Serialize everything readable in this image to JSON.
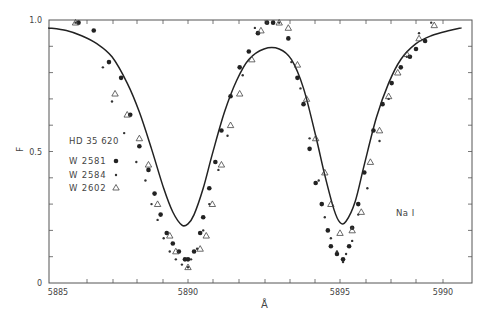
{
  "chart_data": {
    "type": "scatter",
    "title": "",
    "xlabel": "Å",
    "ylabel": "F",
    "xlim": [
      5885.4,
      5899.3
    ],
    "ylim": [
      0,
      1.0
    ],
    "grid": false,
    "x_tick_labels": [
      {
        "label": "5885",
        "px": 58
      },
      {
        "label": "5890",
        "px": 188
      },
      {
        "label": "5895",
        "px": 340
      },
      {
        "label": "5990",
        "px": 443
      }
    ],
    "x_minor_ticks_px": [
      87,
      113,
      137,
      163,
      188,
      213,
      239,
      265,
      290,
      315,
      340,
      366,
      391,
      416,
      443
    ],
    "y_tick_labels": [
      {
        "label": "1.0",
        "value": 1.0
      },
      {
        "label": "0.5",
        "value": 0.5
      },
      {
        "label": "0",
        "value": 0.0
      }
    ],
    "y_minor_ticks": [
      0.1,
      0.2,
      0.3,
      0.4,
      0.5,
      0.6,
      0.7,
      0.8,
      0.9
    ],
    "annotations": [
      {
        "text": "HD 35 620",
        "px": 88,
        "py": 140
      },
      {
        "text": "Na I",
        "px": 402,
        "py": 216
      }
    ],
    "legend": {
      "position": "left-middle",
      "entries": [
        {
          "name": "W 2581",
          "marker": "filled-circle"
        },
        {
          "name": "W 2584",
          "marker": "small-dot"
        },
        {
          "name": "W 2602",
          "marker": "open-triangle"
        }
      ]
    },
    "model_curve": {
      "name": "model profile",
      "x": [
        5885.4,
        5886.0,
        5886.5,
        5887.0,
        5887.5,
        5888.0,
        5888.4,
        5888.8,
        5889.2,
        5889.5,
        5889.8,
        5890.0,
        5890.2,
        5890.5,
        5890.8,
        5891.2,
        5891.6,
        5892.0,
        5892.5,
        5893.0,
        5893.4,
        5893.8,
        5894.2,
        5894.5,
        5894.8,
        5895.0,
        5895.2,
        5895.5,
        5895.8,
        5896.2,
        5896.6,
        5897.0,
        5897.5,
        5898.0,
        5898.6,
        5899.0
      ],
      "y": [
        0.97,
        0.96,
        0.94,
        0.91,
        0.86,
        0.76,
        0.65,
        0.51,
        0.36,
        0.27,
        0.22,
        0.225,
        0.26,
        0.36,
        0.49,
        0.65,
        0.77,
        0.85,
        0.89,
        0.89,
        0.85,
        0.74,
        0.56,
        0.41,
        0.28,
        0.23,
        0.235,
        0.31,
        0.45,
        0.63,
        0.76,
        0.85,
        0.91,
        0.94,
        0.96,
        0.97
      ]
    },
    "series": [
      {
        "name": "W 2581",
        "marker": "filled-circle",
        "x": [
          5886.4,
          5886.9,
          5887.4,
          5887.8,
          5888.1,
          5888.4,
          5888.7,
          5888.9,
          5889.1,
          5889.3,
          5889.5,
          5889.7,
          5889.9,
          5890.0,
          5890.2,
          5890.4,
          5890.5,
          5890.7,
          5890.9,
          5891.1,
          5891.4,
          5891.7,
          5892.0,
          5892.3,
          5892.6,
          5892.8,
          5893.3,
          5893.6,
          5893.8,
          5894.0,
          5894.2,
          5894.4,
          5894.6,
          5894.7,
          5894.9,
          5895.1,
          5895.3,
          5895.4,
          5895.6,
          5895.8,
          5896.1,
          5896.4,
          5896.7,
          5897.0,
          5897.3,
          5897.5,
          5897.8
        ],
        "y": [
          0.99,
          0.96,
          0.84,
          0.78,
          0.64,
          0.52,
          0.43,
          0.34,
          0.26,
          0.19,
          0.15,
          0.12,
          0.09,
          0.09,
          0.12,
          0.19,
          0.25,
          0.36,
          0.46,
          0.58,
          0.71,
          0.82,
          0.88,
          0.95,
          0.99,
          0.99,
          0.93,
          0.78,
          0.68,
          0.51,
          0.38,
          0.3,
          0.2,
          0.14,
          0.11,
          0.09,
          0.14,
          0.21,
          0.3,
          0.42,
          0.58,
          0.68,
          0.76,
          0.82,
          0.86,
          0.89,
          0.92
        ]
      },
      {
        "name": "W 2584",
        "marker": "small-dot",
        "x": [
          5886.3,
          5887.2,
          5887.5,
          5887.9,
          5888.3,
          5888.6,
          5888.8,
          5889.0,
          5889.2,
          5889.4,
          5889.6,
          5889.8,
          5890.0,
          5890.1,
          5890.3,
          5890.5,
          5890.7,
          5891.0,
          5891.3,
          5891.8,
          5892.2,
          5892.6,
          5893.0,
          5893.4,
          5893.7,
          5894.0,
          5894.3,
          5894.5,
          5894.7,
          5894.9,
          5895.1,
          5895.2,
          5895.4,
          5895.6,
          5895.9,
          5896.3,
          5896.6,
          5897.2,
          5897.6,
          5898.0
        ],
        "y": [
          0.99,
          0.82,
          0.69,
          0.57,
          0.46,
          0.39,
          0.3,
          0.24,
          0.17,
          0.12,
          0.09,
          0.07,
          0.06,
          0.09,
          0.13,
          0.2,
          0.3,
          0.43,
          0.56,
          0.79,
          0.97,
          0.99,
          0.99,
          0.84,
          0.74,
          0.55,
          0.39,
          0.25,
          0.17,
          0.12,
          0.08,
          0.11,
          0.16,
          0.26,
          0.36,
          0.54,
          0.7,
          0.86,
          0.95,
          0.99
        ]
      },
      {
        "name": "W 2602",
        "marker": "open-triangle",
        "x": [
          5886.3,
          5887.6,
          5888.0,
          5888.4,
          5888.7,
          5889.0,
          5889.4,
          5889.6,
          5890.0,
          5890.4,
          5890.6,
          5890.8,
          5891.1,
          5891.4,
          5891.7,
          5892.1,
          5892.4,
          5893.0,
          5893.3,
          5893.6,
          5893.9,
          5894.2,
          5894.5,
          5894.7,
          5895.0,
          5895.4,
          5895.7,
          5896.0,
          5896.3,
          5896.6,
          5896.9,
          5897.2,
          5897.6,
          5898.1
        ],
        "y": [
          0.99,
          0.72,
          0.64,
          0.55,
          0.45,
          0.3,
          0.18,
          0.12,
          0.06,
          0.13,
          0.18,
          0.3,
          0.45,
          0.6,
          0.72,
          0.85,
          0.96,
          0.99,
          0.97,
          0.83,
          0.7,
          0.55,
          0.42,
          0.3,
          0.19,
          0.2,
          0.27,
          0.46,
          0.58,
          0.71,
          0.8,
          0.87,
          0.93,
          0.98
        ]
      }
    ]
  },
  "labels": {
    "y_axis": "F",
    "x_axis": "Å",
    "star": "HD 35 620",
    "element": "Na I",
    "legend": [
      "W 2581",
      "W 2584",
      "W 2602"
    ]
  }
}
